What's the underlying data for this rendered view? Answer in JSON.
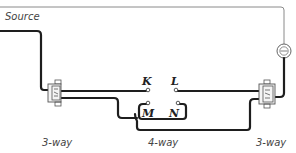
{
  "diagram": {
    "source_label": "Source",
    "terminals": {
      "k": "K",
      "l": "L",
      "m": "M",
      "n": "N"
    },
    "switch_labels": {
      "left": "3-way",
      "center": "4-way",
      "right": "3-way"
    },
    "components": [
      {
        "name": "left-switch",
        "type": "3-way"
      },
      {
        "name": "center-switch",
        "type": "4-way"
      },
      {
        "name": "right-switch",
        "type": "3-way"
      },
      {
        "name": "lamp",
        "type": "lamp"
      }
    ],
    "colors": {
      "wire": "#1e1e1e",
      "neutral_wire": "#8a8a8a",
      "background": "#ffffff"
    }
  }
}
